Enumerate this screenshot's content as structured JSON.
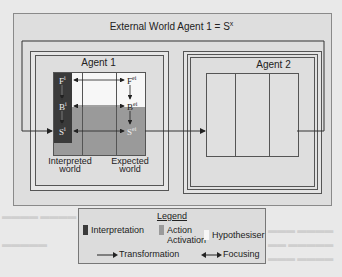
{
  "diagram": {
    "title": "External World Agent 1 = S",
    "title_superscript": "x",
    "agent1": {
      "label": "Agent 1",
      "interpreted_world": {
        "label_line1": "Interpreted",
        "label_line2": "world",
        "cells": [
          {
            "base": "F",
            "sup": "i"
          },
          {
            "base": "B",
            "sup": "i"
          },
          {
            "base": "S",
            "sup": "i"
          }
        ]
      },
      "expected_world": {
        "label_line1": "Expected",
        "label_line2": "world",
        "cells": [
          {
            "base": "F",
            "sup": "ei"
          },
          {
            "base": "B",
            "sup": "ei"
          },
          {
            "base": "S",
            "sup": "ei"
          }
        ]
      }
    },
    "agent2": {
      "label": "Agent 2"
    },
    "colors": {
      "interpretation": "#3a3a3a",
      "action_activation": "#9a9a9a",
      "hypothesiser": "#f7f7f7",
      "background": "#dedede"
    }
  },
  "legend": {
    "title": "Legend",
    "items": [
      {
        "label": "Interpretation",
        "swatch": "interpretation"
      },
      {
        "label_line1": "Action",
        "label_line2": "Activation",
        "swatch": "action_activation"
      },
      {
        "label": "Hypothesiser",
        "swatch": "hypothesiser"
      }
    ],
    "arrows": [
      {
        "label": "Transformation",
        "type": "single-arrow"
      },
      {
        "label": "Focusing",
        "type": "double-arrow"
      }
    ]
  }
}
